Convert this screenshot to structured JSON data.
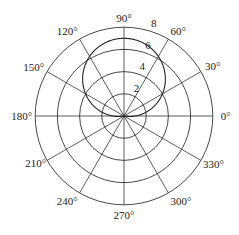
{
  "chart_data": {
    "type": "polar-line",
    "title": "",
    "equation": "r = 1 + 6 sin(theta)",
    "series": [
      {
        "name": "r(theta)",
        "theta_deg": [
          0,
          30,
          60,
          90,
          120,
          150,
          180
        ],
        "r": [
          1,
          4,
          6.2,
          7,
          6.2,
          4,
          1
        ]
      }
    ],
    "radial_axis": {
      "range": [
        0,
        8
      ],
      "ticks": [
        2,
        4,
        6,
        8
      ],
      "tick_labels": [
        "2",
        "4",
        "6",
        "8"
      ],
      "label_angle_deg": 75
    },
    "angular_axis": {
      "ticks_deg": [
        0,
        30,
        60,
        90,
        120,
        150,
        180,
        210,
        240,
        270,
        300,
        330
      ],
      "tick_labels": [
        "0°",
        "30°",
        "60°",
        "90°",
        "120°",
        "150°",
        "180°",
        "210°",
        "240°",
        "270°",
        "300°",
        "330°"
      ]
    },
    "grid": true,
    "legend": null
  },
  "style": {
    "line_color": "#222222",
    "grid_color": "#333333",
    "background": "#ffffff"
  },
  "geometry": {
    "cx": 124,
    "cy": 116,
    "px_per_unit": 11.1
  }
}
